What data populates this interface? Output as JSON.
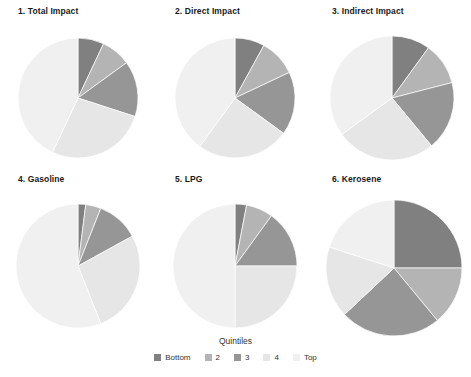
{
  "figure": {
    "legend_title": "Quintiles",
    "background": "#ffffff"
  },
  "colors": {
    "bottom": "#808080",
    "q2": "#b4b4b4",
    "q3": "#969696",
    "q4": "#e6e6e6",
    "top": "#f0f0f0"
  },
  "legend": {
    "title": "Quintiles",
    "items": [
      {
        "label": "Bottom",
        "color": "#808080"
      },
      {
        "label": "2",
        "color": "#b4b4b4"
      },
      {
        "label": "3",
        "color": "#969696"
      },
      {
        "label": "4",
        "color": "#e6e6e6"
      },
      {
        "label": "Top",
        "color": "#f0f0f0"
      }
    ]
  },
  "panels": [
    {
      "title": "1. Total Impact"
    },
    {
      "title": "2. Direct Impact"
    },
    {
      "title": "3. Indirect Impact"
    },
    {
      "title": "4. Gasoline"
    },
    {
      "title": "5. LPG"
    },
    {
      "title": "6. Kerosene"
    }
  ],
  "chart_data": [
    {
      "type": "pie",
      "title": "1. Total Impact",
      "categories": [
        "Bottom",
        "2",
        "3",
        "4",
        "Top"
      ],
      "values": [
        7,
        8,
        15,
        27,
        43
      ],
      "colors": [
        "#808080",
        "#b4b4b4",
        "#969696",
        "#e6e6e6",
        "#f0f0f0"
      ],
      "start_angle": 0,
      "direction": "clockwise",
      "legend": "Quintiles"
    },
    {
      "type": "pie",
      "title": "2. Direct Impact",
      "categories": [
        "Bottom",
        "2",
        "3",
        "4",
        "Top"
      ],
      "values": [
        8,
        10,
        17,
        25,
        40
      ],
      "colors": [
        "#808080",
        "#b4b4b4",
        "#969696",
        "#e6e6e6",
        "#f0f0f0"
      ],
      "start_angle": 0,
      "direction": "clockwise",
      "legend": "Quintiles"
    },
    {
      "type": "pie",
      "title": "3. Indirect Impact",
      "categories": [
        "Bottom",
        "2",
        "3",
        "4",
        "Top"
      ],
      "values": [
        10,
        11,
        18,
        26,
        35
      ],
      "colors": [
        "#808080",
        "#b4b4b4",
        "#969696",
        "#e6e6e6",
        "#f0f0f0"
      ],
      "start_angle": 0,
      "direction": "clockwise",
      "legend": "Quintiles"
    },
    {
      "type": "pie",
      "title": "4. Gasoline",
      "categories": [
        "Bottom",
        "2",
        "3",
        "4",
        "Top"
      ],
      "values": [
        2,
        4,
        11,
        27,
        56
      ],
      "colors": [
        "#808080",
        "#b4b4b4",
        "#969696",
        "#e6e6e6",
        "#f0f0f0"
      ],
      "start_angle": 0,
      "direction": "clockwise",
      "legend": "Quintiles"
    },
    {
      "type": "pie",
      "title": "5. LPG",
      "categories": [
        "Bottom",
        "2",
        "3",
        "4",
        "Top"
      ],
      "values": [
        3,
        7,
        15,
        25,
        50
      ],
      "colors": [
        "#808080",
        "#b4b4b4",
        "#969696",
        "#e6e6e6",
        "#f0f0f0"
      ],
      "start_angle": 0,
      "direction": "clockwise",
      "legend": "Quintiles"
    },
    {
      "type": "pie",
      "title": "6. Kerosene",
      "categories": [
        "Bottom",
        "2",
        "3",
        "4",
        "Top"
      ],
      "values": [
        25,
        14,
        24,
        17,
        20
      ],
      "colors": [
        "#808080",
        "#b4b4b4",
        "#969696",
        "#e6e6e6",
        "#f0f0f0"
      ],
      "start_angle": 0,
      "direction": "clockwise",
      "legend": "Quintiles"
    }
  ],
  "pie_geometry": [
    {
      "cx": 78,
      "cy": 78,
      "r": 60
    },
    {
      "cx": 78,
      "cy": 78,
      "r": 60
    },
    {
      "cx": 78,
      "cy": 78,
      "r": 62
    },
    {
      "cx": 78,
      "cy": 78,
      "r": 62
    },
    {
      "cx": 78,
      "cy": 78,
      "r": 62
    },
    {
      "cx": 80,
      "cy": 80,
      "r": 68
    }
  ]
}
